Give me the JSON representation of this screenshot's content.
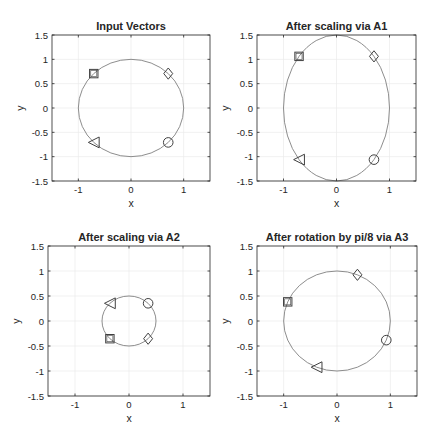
{
  "figure": {
    "width": 438,
    "height": 442,
    "background": "#ffffff",
    "axis_color": "#262626",
    "grid_color": "#ebebeb",
    "curve_color": "#808080",
    "marker_color": "#404040"
  },
  "chart_data": [
    {
      "type": "scatter",
      "title": "Input Vectors",
      "xlabel": "x",
      "ylabel": "y",
      "xlim": [
        -1.5,
        1.5
      ],
      "ylim": [
        -1.5,
        1.5
      ],
      "xticks": [
        -1,
        0,
        1
      ],
      "yticks": [
        -1.5,
        -1,
        -0.5,
        0,
        0.5,
        1,
        1.5
      ],
      "grid": true,
      "curve": {
        "type": "ellipse",
        "rx": 1,
        "ry": 1,
        "rotation_deg": 0
      },
      "points": [
        {
          "marker": "diamond",
          "x": 0.707,
          "y": 0.707
        },
        {
          "marker": "square",
          "x": -0.707,
          "y": 0.707
        },
        {
          "marker": "triangle-left",
          "x": -0.707,
          "y": -0.707
        },
        {
          "marker": "circle",
          "x": 0.707,
          "y": -0.707
        }
      ]
    },
    {
      "type": "scatter",
      "title": "After scaling via A1",
      "xlabel": "x",
      "ylabel": "y",
      "xlim": [
        -1.5,
        1.5
      ],
      "ylim": [
        -1.5,
        1.5
      ],
      "xticks": [
        -1,
        0,
        1
      ],
      "yticks": [
        -1.5,
        -1,
        -0.5,
        0,
        0.5,
        1,
        1.5
      ],
      "grid": true,
      "curve": {
        "type": "ellipse",
        "rx": 1,
        "ry": 1.5,
        "rotation_deg": 0
      },
      "points": [
        {
          "marker": "diamond",
          "x": 0.707,
          "y": 1.061
        },
        {
          "marker": "square",
          "x": -0.707,
          "y": 1.061
        },
        {
          "marker": "triangle-left",
          "x": -0.707,
          "y": -1.061
        },
        {
          "marker": "circle",
          "x": 0.707,
          "y": -1.061
        }
      ]
    },
    {
      "type": "scatter",
      "title": "After scaling via A2",
      "xlabel": "x",
      "ylabel": "y",
      "xlim": [
        -1.5,
        1.5
      ],
      "ylim": [
        -1.5,
        1.5
      ],
      "xticks": [
        -1,
        0,
        1
      ],
      "yticks": [
        -1.5,
        -1,
        -0.5,
        0,
        0.5,
        1,
        1.5
      ],
      "grid": true,
      "curve": {
        "type": "ellipse",
        "rx": 0.5,
        "ry": 0.5,
        "rotation_deg": 0
      },
      "points": [
        {
          "marker": "diamond",
          "x": 0.354,
          "y": -0.354
        },
        {
          "marker": "square",
          "x": -0.354,
          "y": -0.354
        },
        {
          "marker": "triangle-left",
          "x": -0.354,
          "y": 0.354
        },
        {
          "marker": "circle",
          "x": 0.354,
          "y": 0.354
        }
      ]
    },
    {
      "type": "scatter",
      "title": "After rotation by pi/8 via A3",
      "xlabel": "x",
      "ylabel": "y",
      "xlim": [
        -1.5,
        1.5
      ],
      "ylim": [
        -1.5,
        1.5
      ],
      "xticks": [
        -1,
        0,
        1
      ],
      "yticks": [
        -1.5,
        -1,
        -0.5,
        0,
        0.5,
        1,
        1.5
      ],
      "grid": true,
      "curve": {
        "type": "ellipse",
        "rx": 1,
        "ry": 1,
        "rotation_deg": 0
      },
      "points": [
        {
          "marker": "diamond",
          "x": 0.383,
          "y": 0.924
        },
        {
          "marker": "square",
          "x": -0.924,
          "y": 0.383
        },
        {
          "marker": "triangle-left",
          "x": -0.383,
          "y": -0.924
        },
        {
          "marker": "circle",
          "x": 0.924,
          "y": -0.383
        }
      ]
    }
  ],
  "layout": {
    "axes_boxes": [
      {
        "left": 52,
        "top": 35,
        "right": 210,
        "bottom": 181
      },
      {
        "left": 257,
        "top": 35,
        "right": 416,
        "bottom": 181
      },
      {
        "left": 48,
        "top": 246,
        "right": 210,
        "bottom": 396
      },
      {
        "left": 257,
        "top": 246,
        "right": 417,
        "bottom": 396
      }
    ]
  }
}
